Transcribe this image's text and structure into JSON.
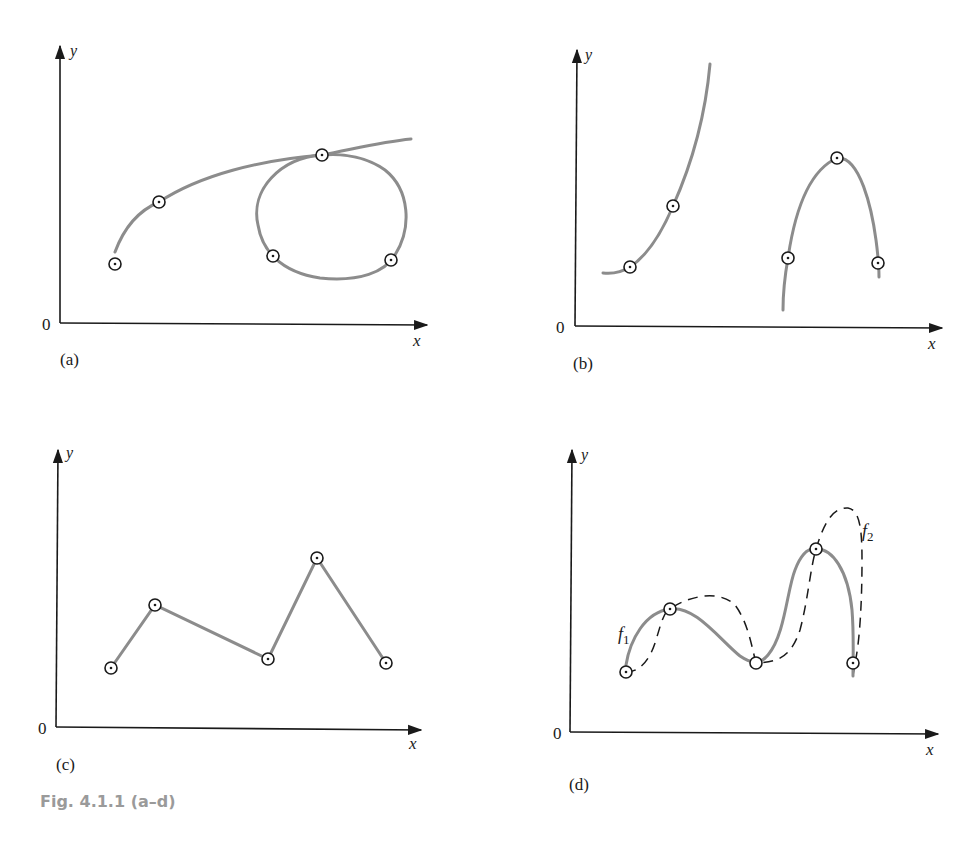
{
  "figure": {
    "caption": "Fig. 4.1.1 (a–d)",
    "colors": {
      "curve": "#8c8c8c",
      "axis": "#1a1a1a",
      "caption": "#9a9a9a"
    }
  },
  "panels": [
    {
      "id": "a",
      "label": "(a)",
      "x_label": "x",
      "y_label": "y",
      "origin_label": "0",
      "description": "curve with a loop through 5 marked points"
    },
    {
      "id": "b",
      "label": "(b)",
      "x_label": "x",
      "y_label": "y",
      "origin_label": "0",
      "description": "two disconnected branches through 5 marked points"
    },
    {
      "id": "c",
      "label": "(c)",
      "x_label": "x",
      "y_label": "y",
      "origin_label": "0",
      "description": "piecewise-linear path through 5 marked points"
    },
    {
      "id": "d",
      "label": "(d)",
      "x_label": "x",
      "y_label": "y",
      "origin_label": "0",
      "description": "two smooth functions f1 (solid) and f2 (dashed) through 5 common points",
      "series_labels": {
        "f1": "f",
        "f1_sub": "1",
        "f2": "f",
        "f2_sub": "2"
      }
    }
  ]
}
